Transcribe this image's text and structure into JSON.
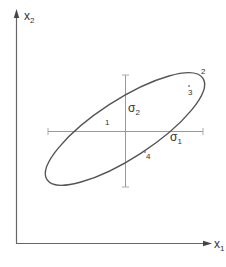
{
  "diagram": {
    "axes": {
      "x_label": "x",
      "x_sub": "1",
      "y_label": "x",
      "y_sub": "2"
    },
    "principal_axes": {
      "sigma1_label": "σ",
      "sigma1_sub": "1",
      "sigma2_label": "σ",
      "sigma2_sub": "2"
    },
    "points": [
      {
        "id": "1",
        "label": "1"
      },
      {
        "id": "2",
        "label": "2"
      },
      {
        "id": "3",
        "label": "3"
      },
      {
        "id": "4",
        "label": "4"
      }
    ],
    "colors": {
      "line": "#555555",
      "axis": "#666666",
      "cross": "#999999"
    }
  }
}
